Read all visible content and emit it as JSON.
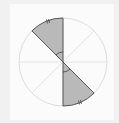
{
  "diagram": {
    "type": "circle-sectors",
    "center": [
      63,
      62
    ],
    "radius": 44,
    "divisions": 8,
    "shaded_sectors": [
      {
        "from_deg": 90,
        "to_deg": 135,
        "label": "upper-left sector"
      },
      {
        "from_deg": 270,
        "to_deg": 315,
        "label": "lower-right sector"
      }
    ],
    "colors": {
      "shade": "#b9b9b9",
      "outline": "#444444",
      "faint_lines": "#dddddd",
      "background": "#fbfbfb"
    }
  }
}
